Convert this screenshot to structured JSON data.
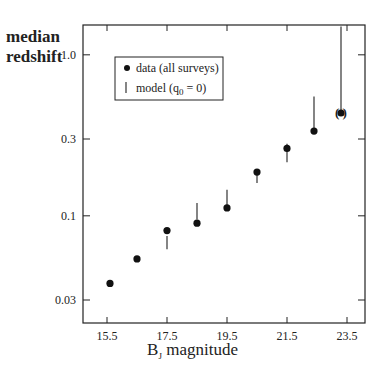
{
  "chart_data": {
    "type": "scatter",
    "title": "",
    "xlabel": "B_J magnitude",
    "ylabel": "median redshift",
    "yscale": "log",
    "xlim": [
      14.7,
      24.2
    ],
    "ylim": [
      0.022,
      1.8
    ],
    "grid": false,
    "legend_position": "upper left",
    "x_ticks": [
      15.5,
      17.5,
      19.5,
      21.5,
      23.5
    ],
    "x_tick_labels": [
      "15.5",
      "17.5",
      "19.5",
      "21.5",
      "23.5"
    ],
    "y_ticks": [
      0.03,
      0.1,
      0.3,
      1.0
    ],
    "y_tick_labels": [
      "0.03",
      "0.1",
      "0.3",
      "1.0"
    ],
    "legend": [
      {
        "marker": "filled-circle",
        "label": "data (all surveys)"
      },
      {
        "marker": "vertical-bar",
        "label": "model (q0 = 0)"
      }
    ],
    "series": [
      {
        "name": "data (all surveys)",
        "x": [
          15.6,
          16.5,
          17.5,
          18.5,
          19.5,
          20.5,
          21.5,
          22.4,
          23.3
        ],
        "y": [
          0.038,
          0.054,
          0.081,
          0.09,
          0.112,
          0.187,
          0.262,
          0.336,
          0.435
        ],
        "annotations": [
          {
            "index": 8,
            "text": "( )"
          }
        ]
      },
      {
        "name": "model (q0 = 0)",
        "x": [
          17.5,
          18.5,
          19.5,
          20.5,
          21.5,
          22.4,
          23.3
        ],
        "y_low": [
          0.062,
          0.095,
          0.115,
          0.16,
          0.215,
          0.34,
          0.43
        ],
        "y_high": [
          0.075,
          0.12,
          0.145,
          0.19,
          0.28,
          0.55,
          1.5
        ]
      }
    ]
  },
  "labels": {
    "ylabel_line1": "median",
    "ylabel_line2": "redshift",
    "xlabel_main": "B",
    "xlabel_sub": "J",
    "xlabel_rest": " magnitude",
    "legend_data": "data (all surveys)",
    "legend_model_pre": "model (q",
    "legend_model_sub": "0",
    "legend_model_post": " = 0)",
    "paren_note": "(   )"
  }
}
